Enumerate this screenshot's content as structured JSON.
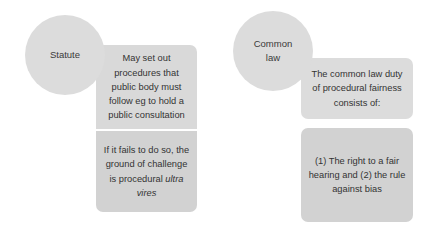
{
  "diagram": {
    "type": "two-column source-of-procedural-duty diagram",
    "columns": [
      {
        "circle": {
          "label": "Statute"
        },
        "boxes": [
          {
            "text": "May set out procedures that public body must follow eg to hold a public consultation"
          },
          {
            "text_before": "If it fails to do so, the ground of challenge is procedural ",
            "text_italic": "ultra vires",
            "text_after": ""
          }
        ]
      },
      {
        "circle": {
          "label_line1": "Common",
          "label_line2": "law"
        },
        "boxes": [
          {
            "text": "The common law duty of procedural fairness consists of:"
          },
          {
            "text": "(1) The right to a fair hearing and (2) the rule against bias"
          }
        ]
      }
    ]
  },
  "colors": {
    "background": "#ffffff",
    "circle_fill": "#dcdcdc",
    "box_fill_light": "#d9d9d9",
    "box_fill_dark": "#d2d2d2",
    "text": "#333333"
  }
}
